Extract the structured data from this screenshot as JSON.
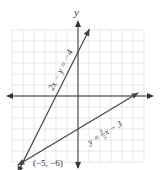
{
  "chart_data": {
    "type": "line",
    "title": "",
    "xlabel": "",
    "ylabel": "y",
    "xlim": [
      -6,
      6
    ],
    "ylim": [
      -6,
      6
    ],
    "grid": true,
    "series": [
      {
        "name": "2x − y = −4",
        "equation": "y = 2x + 4",
        "slope": 2,
        "intercept": 4,
        "x_range": [
          -5.5,
          1.05
        ]
      },
      {
        "name": "y = 3/5 x − 3",
        "equation": "y = 0.6x - 3",
        "slope": 0.6,
        "intercept": -3,
        "x_range": [
          -5.5,
          5.5
        ]
      }
    ],
    "annotations": [
      {
        "text": "(−5, −6)",
        "x": -5,
        "y": -6
      }
    ]
  },
  "labels": {
    "y_axis": "y",
    "line1": "2x − y = −4",
    "line2_prefix": "y = ",
    "line2_num": "3",
    "line2_den": "5",
    "line2_suffix": " x − 3",
    "point": "(−5, −6)"
  },
  "colors": {
    "grid": "#d6d6d6",
    "axis": "#333333",
    "line": "#444444",
    "text": "#333333"
  }
}
